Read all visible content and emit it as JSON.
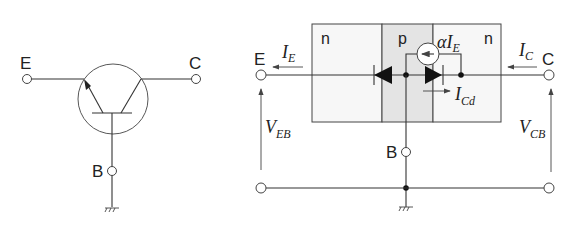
{
  "symbol": {
    "terminals": {
      "emitter": "E",
      "collector": "C",
      "base": "B"
    }
  },
  "model": {
    "terminals": {
      "emitter": "E",
      "collector": "C",
      "base": "B"
    },
    "regions": [
      "n",
      "p",
      "n"
    ],
    "currents": {
      "emitter": {
        "main": "I",
        "sub": "E"
      },
      "collector": {
        "main": "I",
        "sub": "C"
      },
      "diode": {
        "main": "I",
        "sub": "Cd"
      },
      "source": {
        "prefix": "αI",
        "sub": "E"
      }
    },
    "voltages": {
      "emitter_base": {
        "main": "V",
        "sub": "EB"
      },
      "collector_base": {
        "main": "V",
        "sub": "CB"
      }
    }
  }
}
